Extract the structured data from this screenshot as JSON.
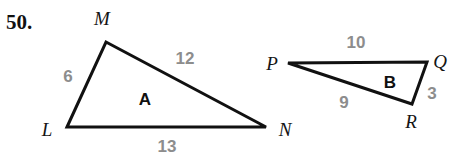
{
  "problem": {
    "number": "50."
  },
  "colors": {
    "stroke": "#111111",
    "length_text": "#8d8d8d",
    "vertex_text": "#141414",
    "background": "#ffffff"
  },
  "figures": [
    {
      "name": "triangle-a",
      "region_label": "A",
      "vertices": [
        {
          "label": "L",
          "x": 67,
          "y": 127
        },
        {
          "label": "M",
          "x": 106,
          "y": 42
        },
        {
          "label": "N",
          "x": 266,
          "y": 127
        }
      ],
      "sides": [
        {
          "between": "L-M",
          "length": "6"
        },
        {
          "between": "M-N",
          "length": "12"
        },
        {
          "between": "L-N",
          "length": "13"
        }
      ]
    },
    {
      "name": "triangle-b",
      "region_label": "B",
      "vertices": [
        {
          "label": "P",
          "x": 288,
          "y": 63
        },
        {
          "label": "Q",
          "x": 427,
          "y": 62
        },
        {
          "label": "R",
          "x": 412,
          "y": 104
        }
      ],
      "sides": [
        {
          "between": "P-Q",
          "length": "10"
        },
        {
          "between": "P-R",
          "length": "9"
        },
        {
          "between": "Q-R",
          "length": "3"
        }
      ]
    }
  ],
  "labels": {
    "a_len_lm": "6",
    "a_len_mn": "12",
    "a_len_ln": "13",
    "a_region": "A",
    "a_vertex_l": "L",
    "a_vertex_m": "M",
    "a_vertex_n": "N",
    "b_len_pq": "10",
    "b_len_pr": "9",
    "b_len_qr": "3",
    "b_region": "B",
    "b_vertex_p": "P",
    "b_vertex_q": "Q",
    "b_vertex_r": "R"
  }
}
